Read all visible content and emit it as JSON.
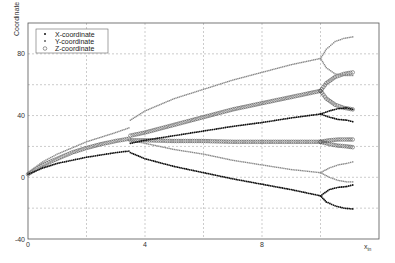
{
  "chart_data": {
    "type": "scatter",
    "title": "",
    "xlabel": "x",
    "xlabel_sub": "in",
    "ylabel": "Coordinate",
    "xlim": [
      0,
      12
    ],
    "ylim": [
      -40,
      100
    ],
    "grid": true,
    "grid_style": "dashed",
    "x_ticks": [
      0,
      4,
      8
    ],
    "x_tick_labels": [
      "0",
      "4",
      "8"
    ],
    "x_grid": [
      2,
      4,
      6,
      8,
      10
    ],
    "y_ticks": [
      -40,
      0,
      40,
      80
    ],
    "y_tick_labels": [
      "-40",
      "0",
      "40",
      "80"
    ],
    "y_grid": [
      -20,
      0,
      20,
      40,
      60,
      80
    ],
    "legend": {
      "placement": "top-left",
      "entries": [
        {
          "label": "X-coordinate",
          "marker": "dot"
        },
        {
          "label": "Y-coordinate",
          "marker": "x-small"
        },
        {
          "label": "Z-coordinate",
          "marker": "circle"
        }
      ]
    },
    "series": [
      {
        "name": "X-coordinate",
        "marker": "dot",
        "color": "#111111",
        "branches": [
          {
            "x": [
              0,
              0.5,
              1,
              1.5,
              2,
              2.5,
              3,
              3.45
            ],
            "y": [
              2,
              6,
              9,
              11,
              13,
              14.5,
              16,
              17
            ]
          },
          {
            "x": [
              3.5,
              4,
              5,
              6,
              7,
              8,
              9,
              10
            ],
            "y": [
              22,
              24,
              27,
              30,
              33,
              35.5,
              38.5,
              41
            ]
          },
          {
            "x": [
              3.5,
              4,
              5,
              6,
              7,
              8,
              9,
              10
            ],
            "y": [
              16,
              12,
              7,
              3,
              -1,
              -4.5,
              -8,
              -12
            ]
          },
          {
            "x": [
              10,
              10.3,
              10.6,
              10.9,
              11.1
            ],
            "y": [
              41,
              43,
              44.5,
              45,
              44
            ]
          },
          {
            "x": [
              10,
              10.3,
              10.6,
              10.9,
              11.1
            ],
            "y": [
              41,
              39,
              37.5,
              37,
              36
            ]
          },
          {
            "x": [
              10,
              10.3,
              10.6,
              10.9,
              11.1
            ],
            "y": [
              -12,
              -8,
              -6.5,
              -6,
              -5
            ]
          },
          {
            "x": [
              10,
              10.2,
              10.5,
              10.8,
              11.1
            ],
            "y": [
              -12,
              -16,
              -18.5,
              -20,
              -20.5
            ]
          }
        ]
      },
      {
        "name": "Y-coordinate",
        "marker": "x-small",
        "color": "#777777",
        "branches": [
          {
            "x": [
              0,
              0.5,
              1,
              1.5,
              2,
              2.5,
              3,
              3.45
            ],
            "y": [
              3,
              10,
              15,
              19,
              23,
              26,
              29,
              32
            ]
          },
          {
            "x": [
              3.5,
              4,
              5,
              6,
              7,
              8,
              9,
              10
            ],
            "y": [
              37,
              43,
              51,
              57,
              63,
              68,
              73,
              77
            ]
          },
          {
            "x": [
              3.5,
              4,
              5,
              6,
              7,
              8,
              9,
              10
            ],
            "y": [
              24,
              22,
              18,
              15,
              11,
              8,
              5,
              3
            ]
          },
          {
            "x": [
              10,
              10.2,
              10.5,
              10.8,
              11.1
            ],
            "y": [
              77,
              83,
              88,
              90,
              91
            ]
          },
          {
            "x": [
              10,
              10.2,
              10.5,
              10.8,
              11.1
            ],
            "y": [
              77,
              71,
              67,
              66,
              66
            ]
          },
          {
            "x": [
              10,
              10.3,
              10.6,
              10.9,
              11.1
            ],
            "y": [
              3,
              6,
              8,
              9,
              10
            ]
          },
          {
            "x": [
              10,
              10.3,
              10.6,
              10.9,
              11.1
            ],
            "y": [
              3,
              0,
              -2,
              -3,
              -3
            ]
          }
        ]
      },
      {
        "name": "Z-coordinate",
        "marker": "circle",
        "color": "#555555",
        "branches": [
          {
            "x": [
              0,
              0.5,
              1,
              1.5,
              2,
              2.5,
              3,
              3.45
            ],
            "y": [
              2,
              8,
              12,
              16,
              19,
              21.5,
              23.5,
              25
            ]
          },
          {
            "x": [
              3.5,
              4,
              5,
              6,
              7,
              8,
              9,
              10
            ],
            "y": [
              27,
              29,
              34,
              39,
              44,
              48,
              52,
              56
            ]
          },
          {
            "x": [
              3.5,
              4,
              5,
              6,
              7,
              8,
              9,
              10
            ],
            "y": [
              24,
              24,
              23.5,
              23.5,
              23,
              23,
              23,
              23
            ]
          },
          {
            "x": [
              10,
              10.2,
              10.5,
              10.8,
              11.1
            ],
            "y": [
              56,
              61,
              65,
              67,
              68
            ]
          },
          {
            "x": [
              10,
              10.2,
              10.5,
              10.8,
              11.1
            ],
            "y": [
              56,
              51,
              47,
              45,
              44
            ]
          },
          {
            "x": [
              10,
              10.3,
              10.6,
              10.9,
              11.1
            ],
            "y": [
              23,
              24,
              24.5,
              24.5,
              24.5
            ]
          },
          {
            "x": [
              10,
              10.3,
              10.6,
              10.9,
              11.1
            ],
            "y": [
              23,
              21.5,
              20.5,
              20,
              19.5
            ]
          }
        ]
      }
    ]
  }
}
